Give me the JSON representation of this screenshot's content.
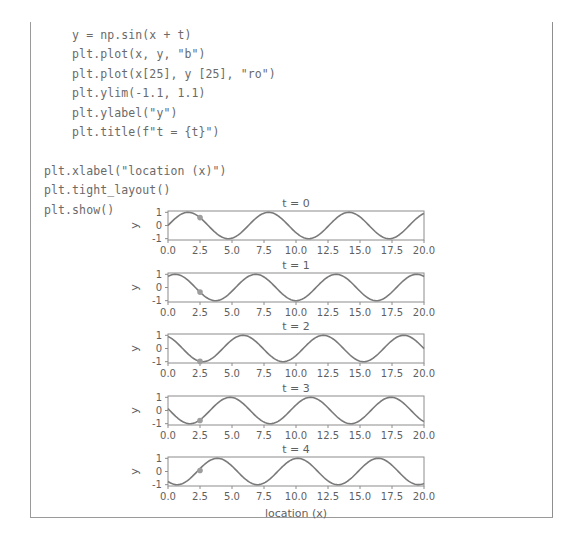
{
  "code": {
    "language": "python",
    "lines": [
      "    y = np.sin(x + t)",
      "    plt.plot(x, y, \"b\")",
      "    plt.plot(x[25], y [25], \"ro\")",
      "    plt.ylim(-1.1, 1.1)",
      "    plt.ylabel(\"y\")",
      "    plt.title(f\"t = {t}\")",
      "",
      "plt.xlabel(\"location (x)\")",
      "plt.tight_layout()",
      "plt.show()"
    ]
  },
  "chart_data": {
    "type": "line",
    "title": "",
    "xlabel": "location (x)",
    "ylabel": "y",
    "xlim": [
      0,
      20
    ],
    "ylim": [
      -1.1,
      1.1
    ],
    "xticks": [
      0.0,
      2.5,
      5.0,
      7.5,
      10.0,
      12.5,
      15.0,
      17.5,
      20.0
    ],
    "xticklabels": [
      "0.0",
      "2.5",
      "5.0",
      "7.5",
      "10.0",
      "12.5",
      "15.0",
      "17.5",
      "20.0"
    ],
    "yticks": [
      1,
      0,
      -1
    ],
    "yticklabels": [
      "1",
      "0",
      "-1"
    ],
    "grid": false,
    "legend": false,
    "line_color": "#7a7a7a",
    "marker_color": "#9d9d9d",
    "axes_color": "#8c8c8c",
    "text_color": "#5f5f5f",
    "marker_x": 2.5,
    "npoints": 201,
    "subplots": [
      {
        "title": "t = 0",
        "t": 0,
        "formula": "sin(x + 0)",
        "marker": {
          "x": 2.5,
          "y": 0.5985
        }
      },
      {
        "title": "t = 1",
        "t": 1,
        "formula": "sin(x + 1)",
        "marker": {
          "x": 2.5,
          "y": -0.3508
        }
      },
      {
        "title": "t = 2",
        "t": 2,
        "formula": "sin(x + 2)",
        "marker": {
          "x": 2.5,
          "y": -0.9775
        }
      },
      {
        "title": "t = 3",
        "t": 3,
        "formula": "sin(x + 3)",
        "marker": {
          "x": 2.5,
          "y": -0.7568
        }
      },
      {
        "title": "t = 4",
        "t": 4,
        "formula": "sin(x + 4)",
        "marker": {
          "x": 2.5,
          "y": 0.0752
        }
      }
    ]
  }
}
